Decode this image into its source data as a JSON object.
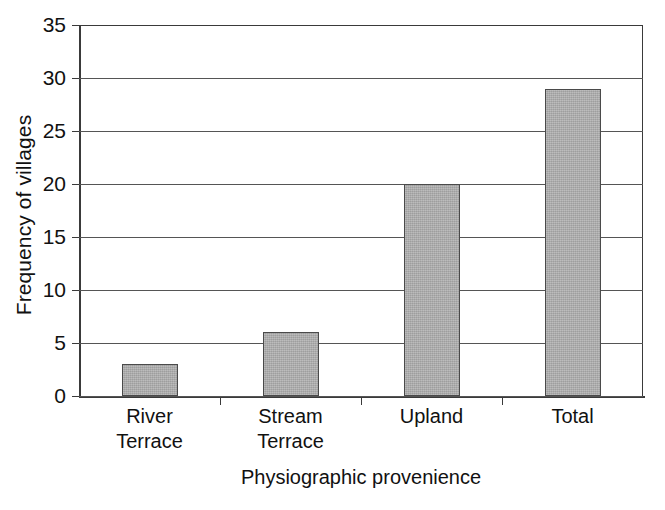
{
  "chart_data": {
    "type": "bar",
    "title": "",
    "xlabel": "Physiographic provenience",
    "ylabel": "Frequency of villages",
    "categories": [
      "River Terrace",
      "Stream Terrace",
      "Upland",
      "Total"
    ],
    "category_lines": [
      [
        "River",
        "Terrace"
      ],
      [
        "Stream",
        "Terrace"
      ],
      [
        "Upland"
      ],
      [
        "Total"
      ]
    ],
    "values": [
      3,
      6,
      20,
      29
    ],
    "ylim": [
      0,
      35
    ],
    "ytick_step": 5,
    "yticks": [
      "0",
      "5",
      "10",
      "15",
      "20",
      "25",
      "30",
      "35"
    ],
    "grid": true,
    "legend": false,
    "bar_color": "#adadad",
    "bar_border_color": "#4a4a4a",
    "axis_color": "#3a3a3a",
    "background": "#ffffff"
  }
}
